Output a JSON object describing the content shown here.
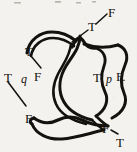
{
  "figure": {
    "kind": "ink-line-diagram",
    "background_color": "#f4f2ee",
    "ink_color": "#14120f",
    "width": 137,
    "height": 152
  },
  "labels": [
    {
      "id": "f-top-right",
      "text": "F",
      "x": 108,
      "y": 6,
      "size": 13,
      "style": "roman"
    },
    {
      "id": "t-top-right",
      "text": "T",
      "x": 88,
      "y": 20,
      "size": 13,
      "style": "roman"
    },
    {
      "id": "t-upper-left",
      "text": "T",
      "x": 25,
      "y": 45,
      "size": 13,
      "style": "roman"
    },
    {
      "id": "t-left",
      "text": "T",
      "x": 4,
      "y": 71,
      "size": 13,
      "style": "roman"
    },
    {
      "id": "q-left",
      "text": "q",
      "x": 21,
      "y": 73,
      "size": 12,
      "style": "italic"
    },
    {
      "id": "f-left",
      "text": "F",
      "x": 34,
      "y": 70,
      "size": 13,
      "style": "roman"
    },
    {
      "id": "t-right",
      "text": "T",
      "x": 93,
      "y": 71,
      "size": 13,
      "style": "roman"
    },
    {
      "id": "p-right",
      "text": "p",
      "x": 106,
      "y": 73,
      "size": 12,
      "style": "italic"
    },
    {
      "id": "f-right",
      "text": "F.",
      "x": 116,
      "y": 70,
      "size": 13,
      "style": "roman"
    },
    {
      "id": "f-lower-left",
      "text": "F",
      "x": 25,
      "y": 112,
      "size": 13,
      "style": "roman"
    },
    {
      "id": "f-bottom-right",
      "text": "F",
      "x": 102,
      "y": 122,
      "size": 13,
      "style": "roman"
    },
    {
      "id": "t-bottom-right",
      "text": "T",
      "x": 116,
      "y": 136,
      "size": 13,
      "style": "roman"
    }
  ],
  "leader_lines": [
    {
      "id": "leader-f-to-t-topright",
      "x1": 107,
      "y1": 14,
      "x2": 96,
      "y2": 24
    },
    {
      "id": "leader-t-topright-to-knot",
      "x1": 88,
      "y1": 30,
      "x2": 72,
      "y2": 42
    },
    {
      "id": "leader-t-upperleft-down",
      "x1": 31,
      "y1": 56,
      "x2": 41,
      "y2": 68
    },
    {
      "id": "leader-t-left-to-f",
      "x1": 8,
      "y1": 82,
      "x2": 26,
      "y2": 106
    },
    {
      "id": "leader-f-bottomright-to-t",
      "x1": 111,
      "y1": 130,
      "x2": 118,
      "y2": 134
    }
  ],
  "strokes": {
    "count": 6,
    "note": "Two interlaced ribbons crossing near top-centre and bottom-centre"
  }
}
